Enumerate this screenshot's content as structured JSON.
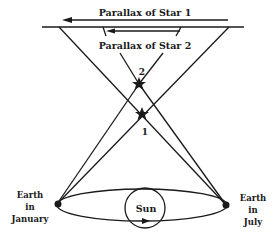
{
  "diagram": {
    "labels": {
      "parallax_star1": "Parallax of Star 1",
      "parallax_star2": "Parallax of Star 2",
      "star1": "1",
      "star2": "2",
      "sun": "Sun",
      "earth_january": [
        "Earth",
        "in",
        "January"
      ],
      "earth_july": [
        "Earth",
        "in",
        "July"
      ]
    },
    "colors": {
      "ink": "#1a1a1a",
      "background": "#ffffff"
    }
  }
}
